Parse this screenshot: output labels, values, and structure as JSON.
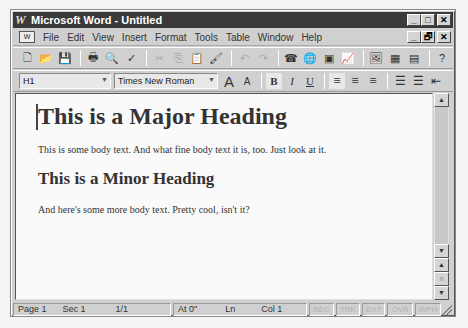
{
  "window": {
    "title": "Microsoft Word - Untitled",
    "app_icon": "W",
    "controls": {
      "minimize": "_",
      "maximize": "□",
      "close": "✕"
    }
  },
  "menubar": {
    "doc_icon": "W",
    "items": [
      {
        "label": "File"
      },
      {
        "label": "Edit"
      },
      {
        "label": "View"
      },
      {
        "label": "Insert"
      },
      {
        "label": "Format"
      },
      {
        "label": "Tools"
      },
      {
        "label": "Table"
      },
      {
        "label": "Window"
      },
      {
        "label": "Help"
      }
    ],
    "doc_controls": {
      "minimize": "_",
      "restore": "🗗",
      "close": "✕"
    }
  },
  "standard_toolbar": {
    "buttons": [
      {
        "name": "new-icon",
        "glyph": "🗋"
      },
      {
        "name": "open-icon",
        "glyph": "📂"
      },
      {
        "name": "save-icon",
        "glyph": "💾"
      },
      {
        "name": "print-icon",
        "glyph": "🖶"
      },
      {
        "name": "print-preview-icon",
        "glyph": "🔍"
      },
      {
        "name": "spelling-icon",
        "glyph": "✓"
      },
      {
        "name": "cut-icon",
        "glyph": "✂"
      },
      {
        "name": "copy-icon",
        "glyph": "⎘"
      },
      {
        "name": "paste-icon",
        "glyph": "📋"
      },
      {
        "name": "format-painter-icon",
        "glyph": "🖌"
      },
      {
        "name": "undo-icon",
        "glyph": "↶"
      },
      {
        "name": "redo-icon",
        "glyph": "↷"
      },
      {
        "name": "address-book-icon",
        "glyph": "☎"
      },
      {
        "name": "insert-hyperlink-icon",
        "glyph": "🌐"
      },
      {
        "name": "insert-map-icon",
        "glyph": "▣"
      },
      {
        "name": "insert-chart-icon",
        "glyph": "📈"
      },
      {
        "name": "insert-picture-icon",
        "glyph": "🖼"
      },
      {
        "name": "insert-frame-icon",
        "glyph": "▦"
      },
      {
        "name": "insert-table-icon",
        "glyph": "▤"
      },
      {
        "name": "help-icon",
        "glyph": "?"
      }
    ]
  },
  "format_toolbar": {
    "style_value": "H1",
    "font_value": "Times New Roman",
    "grow_font": "A",
    "shrink_font": "A",
    "bold": "B",
    "italic": "I",
    "underline": "U",
    "align_left": "≡",
    "align_center": "≡",
    "align_right": "≡",
    "numbered_list": "☰",
    "bulleted_list": "☰",
    "decrease_indent": "⇤"
  },
  "document": {
    "heading1": "This is a Major Heading",
    "body1": "This is some body text. And what fine body text it is, too. Just look at it.",
    "heading2": "This is a Minor Heading",
    "body2": "And here's some more body text. Pretty cool, isn't it?"
  },
  "scrollbar": {
    "up": "▲",
    "down": "▼",
    "prev_page": "▲",
    "select_browse": "○",
    "next_page": "▼"
  },
  "statusbar": {
    "page": "Page 1",
    "sec": "Sec 1",
    "pages": "1/1",
    "at": "At 0\"",
    "ln": "Ln",
    "col": "Col 1",
    "rec": "REC",
    "trk": "TRK",
    "ext": "EXT",
    "ovr": "OVR",
    "wph": "WPH"
  }
}
